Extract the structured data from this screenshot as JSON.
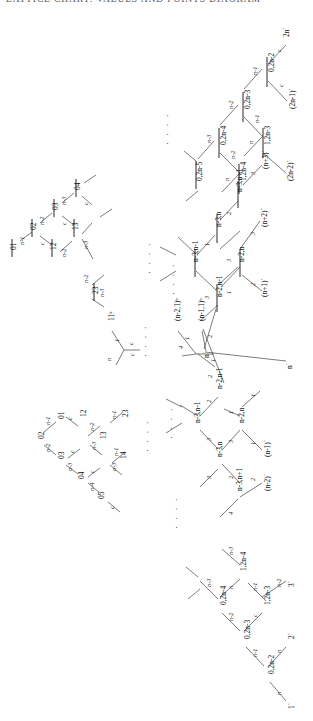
{
  "header": {
    "running_head": "LATTICE  CHART:  VALUES  AND  POINTS  DIAGRAM"
  },
  "diagram": {
    "type": "hasse-lattice-diagram",
    "orientation": "rotated-90-ccw",
    "edge_weight_labels": [
      "c",
      "n",
      "n-1",
      "n-2",
      "n-3",
      "n-4",
      "1",
      "2",
      "3",
      "4"
    ],
    "ellipsis": "· · · ·",
    "clusters": [
      {
        "id": "top-right-barred",
        "name": "barred 0,2n family (upper right)",
        "vertices": [
          "0̅2n-2",
          "0̅2n-3",
          "0̅2n-4",
          "1̅2n-3",
          "1̅2n-4",
          "2n*",
          "(2n-1)*",
          "(2n-2)*"
        ],
        "edges": [
          "c",
          "n",
          "n-1",
          "n-2",
          "n-3"
        ]
      },
      {
        "id": "mid-right-barred",
        "name": "barred n-3,n family (middle upper right)",
        "vertices": [
          "n̅-3,n-1",
          "n̅-3,n",
          "n̅-3,n+1",
          "n̅-2,n-1",
          "n̅-2,n",
          "(n+1)*",
          "(n+2)*",
          "(n+3)*"
        ],
        "edges": [
          "1",
          "2",
          "3",
          "4"
        ]
      },
      {
        "id": "left-barred",
        "name": "barred 0x family (middle left)",
        "vertices": [
          "0̅1",
          "0̅2",
          "0̅3",
          "0̅4",
          "1̅2",
          "1̅3",
          "2̅3"
        ],
        "edges": [
          "c",
          "n-1",
          "n-2",
          "n-3",
          "n-4"
        ]
      },
      {
        "id": "center-hub",
        "name": "central b-labelled vertices and hub",
        "vertices": [
          "11ᵇ",
          "(n-2,1)ᵇ",
          "(n-1,1)ᵇ",
          "n*"
        ],
        "edges": [
          "c",
          "n",
          "1",
          "2",
          "3",
          "4"
        ]
      },
      {
        "id": "bottom-left",
        "name": "unbarred 0x family (lower left)",
        "vertices": [
          "01",
          "02",
          "03",
          "04",
          "05",
          "12",
          "13",
          "14",
          "23"
        ],
        "edges": [
          "c",
          "n-1",
          "n-2",
          "n-3",
          "n-4"
        ]
      },
      {
        "id": "mid-right-unbarred",
        "name": "unbarred n-3,n family (middle lower right)",
        "vertices": [
          "n-3,n-1",
          "n-3,n",
          "n-3,n+1",
          "n-2,n-1",
          "n-2,n",
          "(n-1)*",
          "(n-2)*",
          "n*"
        ],
        "edges": [
          "1",
          "2",
          "3",
          "4"
        ]
      },
      {
        "id": "bottom-right",
        "name": "unbarred 0,2n family (lower right)",
        "vertices": [
          "0,2n-2",
          "0,2n-3",
          "0,2n-4",
          "1,2n-3",
          "1,2n-4",
          "1*",
          "2*",
          "3*"
        ],
        "edges": [
          "c",
          "n",
          "n-1",
          "n-2",
          "n-3"
        ]
      }
    ]
  },
  "nodes": [
    {
      "id": "n_2n_star",
      "text": "2n˙",
      "x": 289,
      "y": 28,
      "rot": -90,
      "bar": false
    },
    {
      "id": "n_b02n2",
      "text": "0,2n-2",
      "x": 272,
      "y": 63,
      "rot": -90,
      "bar": true
    },
    {
      "id": "n_2n1star",
      "text": "(2n-1)˙",
      "x": 293,
      "y": 100,
      "rot": -90,
      "bar": false
    },
    {
      "id": "n_b02n3",
      "text": "0,2n-3",
      "x": 248,
      "y": 100,
      "rot": -90,
      "bar": true
    },
    {
      "id": "n_b12n3",
      "text": "1,2n-3",
      "x": 268,
      "y": 136,
      "rot": -90,
      "bar": true
    },
    {
      "id": "n_2n2star",
      "text": "(2n-2)˙",
      "x": 291,
      "y": 172,
      "rot": -90,
      "bar": false
    },
    {
      "id": "n_b02n4",
      "text": "0,2n-4",
      "x": 224,
      "y": 136,
      "rot": -90,
      "bar": true
    },
    {
      "id": "n_b12n4",
      "text": "1,2n-4",
      "x": 244,
      "y": 172,
      "rot": -90,
      "bar": true
    },
    {
      "id": "n_b02n5",
      "text": "0,2n-5",
      "x": 200,
      "y": 172,
      "rot": -90,
      "bar": true
    },
    {
      "id": "n_bn3n1",
      "text": "n-3,n-1",
      "x": 196,
      "y": 253,
      "rot": -90,
      "bar": true
    },
    {
      "id": "n_bn3n",
      "text": "n-3,n",
      "x": 219,
      "y": 218,
      "rot": -90,
      "bar": true
    },
    {
      "id": "n_bn3n1p",
      "text": "n-3,n+1",
      "x": 240,
      "y": 183,
      "rot": -90,
      "bar": true
    },
    {
      "id": "n_bn2n1",
      "text": "n-2,n-1",
      "x": 220,
      "y": 288,
      "rot": -90,
      "bar": true
    },
    {
      "id": "n_bn2n",
      "text": "n-2,n",
      "x": 242,
      "y": 253,
      "rot": -90,
      "bar": true
    },
    {
      "id": "n_n3star",
      "text": "(n+3)˙",
      "x": 266,
      "y": 160,
      "rot": -90,
      "bar": false
    },
    {
      "id": "n_n2star",
      "text": "(n+2)˙",
      "x": 265,
      "y": 218,
      "rot": -90,
      "bar": false
    },
    {
      "id": "n_n1star",
      "text": "(n+1)˙",
      "x": 265,
      "y": 288,
      "rot": -90,
      "bar": false
    },
    {
      "id": "n_b01",
      "text": "01",
      "x": 14,
      "y": 239,
      "rot": -90,
      "bar": true
    },
    {
      "id": "n_b02",
      "text": "02",
      "x": 34,
      "y": 219,
      "rot": -90,
      "bar": true
    },
    {
      "id": "n_b03",
      "text": "03",
      "x": 56,
      "y": 199,
      "rot": -90,
      "bar": true
    },
    {
      "id": "n_b04",
      "text": "04",
      "x": 78,
      "y": 179,
      "rot": -90,
      "bar": true
    },
    {
      "id": "n_b12",
      "text": "12",
      "x": 54,
      "y": 239,
      "rot": -90,
      "bar": true
    },
    {
      "id": "n_b13",
      "text": "13",
      "x": 76,
      "y": 219,
      "rot": -90,
      "bar": true
    },
    {
      "id": "n_b23",
      "text": "23",
      "x": 96,
      "y": 283,
      "rot": -90,
      "bar": true
    },
    {
      "id": "n_11b",
      "text": "11ᵇ",
      "x": 112,
      "y": 312,
      "rot": -90,
      "bar": false
    },
    {
      "id": "n_n21b",
      "text": "(n-2,1)ᵇ",
      "x": 178,
      "y": 312,
      "rot": -90,
      "bar": false
    },
    {
      "id": "n_n11b",
      "text": "(n-1,1)ᵇ",
      "x": 202,
      "y": 312,
      "rot": -90,
      "bar": false
    },
    {
      "id": "n_nstar_hub",
      "text": "n˙",
      "x": 208,
      "y": 347,
      "rot": -90,
      "bar": false
    },
    {
      "id": "n_nstar_low",
      "text": "n˙",
      "x": 290,
      "y": 358,
      "rot": -90,
      "bar": false
    },
    {
      "id": "n_01",
      "text": "01",
      "x": 62,
      "y": 410,
      "rot": -90,
      "bar": false
    },
    {
      "id": "n_02",
      "text": "02",
      "x": 42,
      "y": 430,
      "rot": -90,
      "bar": false
    },
    {
      "id": "n_03",
      "text": "03",
      "x": 62,
      "y": 450,
      "rot": -90,
      "bar": false
    },
    {
      "id": "n_04",
      "text": "04",
      "x": 82,
      "y": 470,
      "rot": -90,
      "bar": false
    },
    {
      "id": "n_05",
      "text": "05",
      "x": 102,
      "y": 490,
      "rot": -90,
      "bar": false
    },
    {
      "id": "n_12",
      "text": "12",
      "x": 64,
      "y": 410,
      "rot": -90,
      "bar": false
    },
    {
      "id": "n_13",
      "text": "13",
      "x": 86,
      "y": 430,
      "rot": -90,
      "bar": false
    },
    {
      "id": "n_14",
      "text": "14",
      "x": 106,
      "y": 450,
      "rot": -90,
      "bar": false
    },
    {
      "id": "n_23",
      "text": "23",
      "x": 108,
      "y": 410,
      "rot": -90,
      "bar": false
    },
    {
      "id": "n_n3n1",
      "text": "n-3,n-1",
      "x": 198,
      "y": 414,
      "rot": -90,
      "bar": false
    },
    {
      "id": "n_n3n",
      "text": "n-3,n",
      "x": 220,
      "y": 448,
      "rot": -90,
      "bar": false
    },
    {
      "id": "n_n3n1p",
      "text": "n-3,n+1",
      "x": 240,
      "y": 482,
      "rot": -90,
      "bar": false
    },
    {
      "id": "n_n2n1",
      "text": "n-2,n-1",
      "x": 220,
      "y": 380,
      "rot": -90,
      "bar": false
    },
    {
      "id": "n_n2n",
      "text": "n-2,n",
      "x": 242,
      "y": 414,
      "rot": -90,
      "bar": false
    },
    {
      "id": "n_n1star2",
      "text": "(n-1)˙",
      "x": 268,
      "y": 448,
      "rot": -90,
      "bar": false
    },
    {
      "id": "n_n2star2",
      "text": "(n-2)˙",
      "x": 268,
      "y": 482,
      "rot": -90,
      "bar": false
    },
    {
      "id": "n_02n2",
      "text": "0,2n-2",
      "x": 272,
      "y": 665,
      "rot": -90,
      "bar": false
    },
    {
      "id": "n_02n3",
      "text": "0,2n-3",
      "x": 248,
      "y": 630,
      "rot": -90,
      "bar": false
    },
    {
      "id": "n_02n4",
      "text": "0,2n-4",
      "x": 224,
      "y": 596,
      "rot": -90,
      "bar": false
    },
    {
      "id": "n_12n3",
      "text": "1,2n-3",
      "x": 268,
      "y": 596,
      "rot": -90,
      "bar": false
    },
    {
      "id": "n_12n4",
      "text": "1,2n-4",
      "x": 244,
      "y": 562,
      "rot": -90,
      "bar": false
    },
    {
      "id": "n_1star",
      "text": "1˙",
      "x": 292,
      "y": 700,
      "rot": -90,
      "bar": false
    },
    {
      "id": "n_2star",
      "text": "2˙",
      "x": 292,
      "y": 630,
      "rot": -90,
      "bar": false
    },
    {
      "id": "n_3star",
      "text": "3˙",
      "x": 292,
      "y": 578,
      "rot": -90,
      "bar": false
    }
  ]
}
